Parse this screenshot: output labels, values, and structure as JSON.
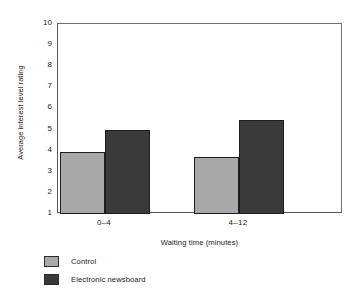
{
  "chart_data": {
    "type": "bar",
    "title": "",
    "xlabel": "Waiting time (minutes)",
    "ylabel": "Average interest level rating",
    "categories": [
      "0–4",
      "4–12"
    ],
    "ylim": [
      1,
      10
    ],
    "yticks": [
      1,
      2,
      3,
      4,
      5,
      6,
      7,
      8,
      9,
      10
    ],
    "ytick_labels": [
      "1",
      "2",
      "3",
      "4",
      "5",
      "6",
      "7",
      "8",
      "9",
      "10"
    ],
    "grid": false,
    "legend_position": "below-left",
    "series": [
      {
        "name": "Control",
        "color": "#a8a8a8",
        "values": [
          3.95,
          3.7
        ]
      },
      {
        "name": "Electronic newsboard",
        "color": "#3a3a3a",
        "values": [
          5.0,
          5.45
        ]
      }
    ],
    "annotations": []
  },
  "legend": {
    "items": [
      {
        "label": "Control",
        "color": "#a8a8a8"
      },
      {
        "label": "Electronic newsboard",
        "color": "#3a3a3a"
      }
    ]
  },
  "axes": {
    "y_title": "Average interest level rating",
    "x_title": "Waiting time (minutes)"
  }
}
